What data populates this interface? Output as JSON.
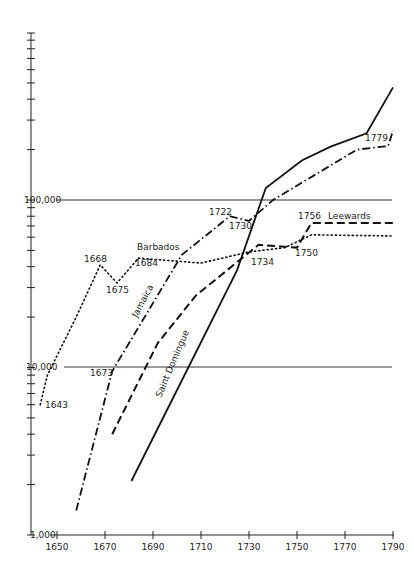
{
  "chart_data": {
    "type": "line",
    "title": "",
    "xlabel": "",
    "ylabel": "",
    "yscale": "log",
    "xlim": [
      1645,
      1792
    ],
    "ylim": [
      1000,
      600000
    ],
    "x_ticks": [
      1650,
      1670,
      1690,
      1710,
      1730,
      1750,
      1770,
      1790
    ],
    "y_tick_labels": [
      "1,000",
      "10,000",
      "100,000"
    ],
    "y_ticks": [
      1000,
      10000,
      100000
    ],
    "grid": "horizontal lines at 10,000 and 100,000",
    "legend": "inline labels",
    "series": [
      {
        "name": "Barbados",
        "style": "dotted",
        "points": [
          [
            1643,
            6000
          ],
          [
            1646,
            9000
          ],
          [
            1658,
            20000
          ],
          [
            1668,
            41000
          ],
          [
            1675,
            32000
          ],
          [
            1684,
            45000
          ],
          [
            1710,
            42000
          ],
          [
            1730,
            49000
          ],
          [
            1745,
            52000
          ],
          [
            1756,
            62000
          ],
          [
            1790,
            61000
          ]
        ]
      },
      {
        "name": "Jamaica",
        "style": "dash-dot",
        "points": [
          [
            1658,
            1400
          ],
          [
            1673,
            9500
          ],
          [
            1702,
            47000
          ],
          [
            1722,
            80000
          ],
          [
            1730,
            75000
          ],
          [
            1740,
            100000
          ],
          [
            1775,
            200000
          ],
          [
            1788,
            210000
          ],
          [
            1790,
            260000
          ]
        ]
      },
      {
        "name": "Leewards",
        "style": "dashed",
        "points": [
          [
            1673,
            4000
          ],
          [
            1692,
            14000
          ],
          [
            1708,
            27000
          ],
          [
            1734,
            54000
          ],
          [
            1750,
            52000
          ],
          [
            1756,
            73000
          ],
          [
            1790,
            73000
          ]
        ]
      },
      {
        "name": "Saint Domingue",
        "style": "solid",
        "points": [
          [
            1681,
            2100
          ],
          [
            1725,
            38000
          ],
          [
            1737,
            118000
          ],
          [
            1752,
            172000
          ],
          [
            1764,
            208000
          ],
          [
            1779,
            250000
          ],
          [
            1790,
            470000
          ]
        ]
      }
    ],
    "annotations": [
      "1643",
      "1668",
      "1673",
      "1675",
      "1684",
      "1722",
      "1730",
      "1734",
      "1750",
      "1756",
      "1779"
    ]
  },
  "labels": {
    "y1000": "1,000",
    "y10000": "10,000",
    "y100000": "100,000",
    "x": [
      "1650",
      "1670",
      "1690",
      "1710",
      "1730",
      "1750",
      "1770",
      "1790"
    ],
    "barbados": "Barbados",
    "jamaica": "Jamaica",
    "leewards": "Leewards",
    "saint_domingue": "Saint Domingue",
    "a1643": "1643",
    "a1668": "1668",
    "a1673": "1673",
    "a1675": "1675",
    "a1684": "1684",
    "a1722": "1722",
    "a1730": "1730",
    "a1734": "1734",
    "a1750": "1750",
    "a1756": "1756",
    "a1779": "1779"
  }
}
